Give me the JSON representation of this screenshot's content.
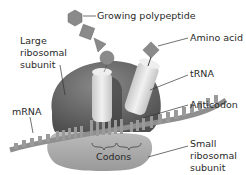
{
  "labels": {
    "growing_polypeptide": "Growing polypeptide",
    "amino_acid": "Amino acid",
    "large_subunit_1": "Large",
    "large_subunit_2": "ribosomal",
    "large_subunit_3": "subunit",
    "trna": "tRNA",
    "mrna": "mRNA",
    "anticodon": "Anticodon",
    "codons": "Codons",
    "small_subunit_1": "Small",
    "small_subunit_2": "ribosomal",
    "small_subunit_3": "subunit"
  },
  "colors": {
    "large_subunit": "#6e6e6e",
    "small_subunit": "#a8a8a8",
    "trna": "#dcdcdc",
    "amino_acid": "#8a8a8a",
    "mrna": "#9a9a9a",
    "leader": "#333333"
  }
}
